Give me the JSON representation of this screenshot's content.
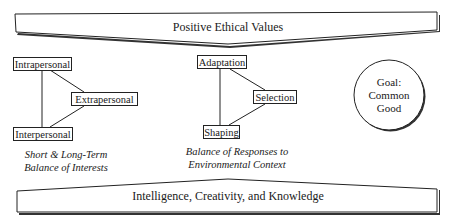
{
  "top_banner": {
    "label": "Positive Ethical Values",
    "direction": "down-arrow"
  },
  "bottom_banner": {
    "label": "Intelligence, Creativity, and Knowledge",
    "direction": "up-arrow"
  },
  "groups": [
    {
      "id": "interests",
      "nodes": [
        "Intrapersonal",
        "Extrapersonal",
        "Interpersonal"
      ],
      "caption": [
        "Short & Long-Term",
        "Balance of Interests"
      ]
    },
    {
      "id": "responses",
      "nodes": [
        "Adaptation",
        "Selection",
        "Shaping"
      ],
      "caption": [
        "Balance of Responses to",
        "Environmental Context"
      ]
    }
  ],
  "goal": {
    "lines": [
      "Goal:",
      "Common",
      "Good"
    ]
  },
  "colors": {
    "stroke": "#222222",
    "background": "#ffffff",
    "text": "#1a1a1a"
  }
}
